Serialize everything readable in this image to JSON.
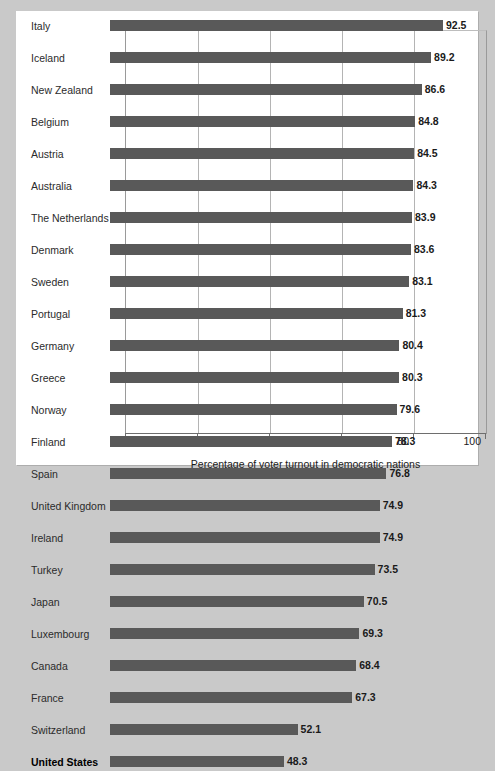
{
  "chart_data": {
    "type": "bar",
    "orientation": "horizontal",
    "title": "",
    "xlabel": "Percentage of voter turnout in democratic nations",
    "ylabel": "",
    "xlim": [
      0,
      100
    ],
    "xticks": [
      0,
      20,
      40,
      60,
      80,
      100
    ],
    "xtick_labels": [
      "0",
      "20",
      "40",
      "60",
      "80",
      "100"
    ],
    "grid": true,
    "grid_axis": "x",
    "legend": false,
    "bar_color": "#595959",
    "highlight_category": "United States",
    "categories": [
      "Italy",
      "Iceland",
      "New Zealand",
      "Belgium",
      "Austria",
      "Australia",
      "The Netherlands",
      "Denmark",
      "Sweden",
      "Portugal",
      "Germany",
      "Greece",
      "Norway",
      "Finland",
      "Spain",
      "United Kingdom",
      "Ireland",
      "Turkey",
      "Japan",
      "Luxembourg",
      "Canada",
      "France",
      "Switzerland",
      "United States"
    ],
    "values": [
      92.5,
      89.2,
      86.6,
      84.8,
      84.5,
      84.3,
      83.9,
      83.6,
      83.1,
      81.3,
      80.4,
      80.3,
      79.6,
      78.3,
      76.8,
      74.9,
      74.9,
      73.5,
      70.5,
      69.3,
      68.4,
      67.3,
      52.1,
      48.3
    ],
    "value_labels": [
      "92.5",
      "89.2",
      "86.6",
      "84.8",
      "84.5",
      "84.3",
      "83.9",
      "83.6",
      "83.1",
      "81.3",
      "80.4",
      "80.3",
      "79.6",
      "78.3",
      "76.8",
      "74.9",
      "74.9",
      "73.5",
      "70.5",
      "69.3",
      "68.4",
      "67.3",
      "52.1",
      "48.3"
    ]
  }
}
